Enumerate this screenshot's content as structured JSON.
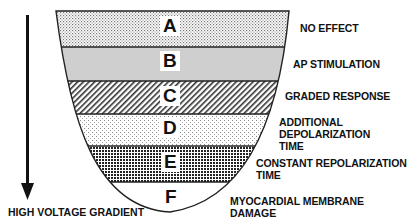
{
  "axis": {
    "label": "HIGH VOLTAGE GRADIENT",
    "direction": "down"
  },
  "zones": [
    {
      "letter": "A",
      "description_lines": [
        "NO EFFECT"
      ],
      "pattern": "fine-dots"
    },
    {
      "letter": "B",
      "description_lines": [
        "AP STIMULATION"
      ],
      "pattern": "solid-gray"
    },
    {
      "letter": "C",
      "description_lines": [
        "GRADED RESPONSE"
      ],
      "pattern": "diagonal-hatch"
    },
    {
      "letter": "D",
      "description_lines": [
        "ADDITIONAL",
        "DEPOLARIZATION",
        "TIME"
      ],
      "pattern": "light-stipple"
    },
    {
      "letter": "E",
      "description_lines": [
        "CONSTANT REPOLARIZATION",
        "TIME"
      ],
      "pattern": "dense-checker"
    },
    {
      "letter": "F",
      "description_lines": [
        "MYOCARDIAL MEMBRANE",
        "DAMAGE"
      ],
      "pattern": "white"
    }
  ],
  "colors": {
    "outline": "#222222",
    "gray_band": "#cfcfcf",
    "text": "#111111"
  }
}
